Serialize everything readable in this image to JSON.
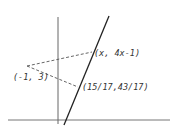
{
  "diagram": {
    "type": "geometry-figure",
    "labels": {
      "general_point": "(x, 4x-1)",
      "external_point": "(-1, 3)",
      "foot_point": "(15/17,43/17)"
    },
    "colors": {
      "axis": "#555555",
      "line": "#222222",
      "dashed": "#555555",
      "text": "#333333",
      "background": "#ffffff"
    },
    "geometry_px": {
      "y_axis": {
        "x": 58,
        "y1": 17,
        "y2": 124
      },
      "x_axis": {
        "y": 120,
        "x1": 8,
        "x2": 170
      },
      "main_line": {
        "x1": 109,
        "y1": 16,
        "x2": 64,
        "y2": 125
      },
      "external_point": {
        "x": 27,
        "y": 66
      },
      "general_point": {
        "x": 92,
        "y": 52
      },
      "foot_point": {
        "x": 78,
        "y": 87
      }
    }
  }
}
